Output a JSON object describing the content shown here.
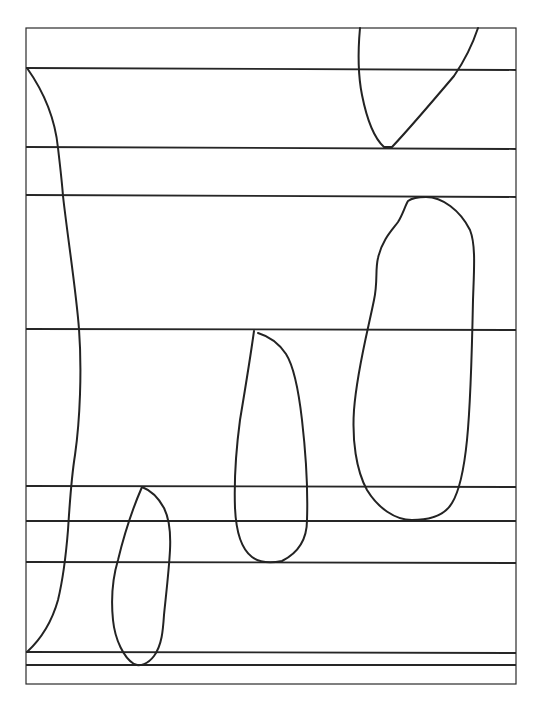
{
  "diagram": {
    "stroke_color": "#232323",
    "background_color": "#ffffff",
    "frame": {
      "x": 26,
      "y": 28,
      "width": 490,
      "height": 656
    },
    "horizontal_lines_y": [
      68,
      148,
      196,
      329,
      486,
      521,
      562,
      652,
      665
    ],
    "shapes": [
      {
        "name": "left-descending-curve",
        "type": "open-curve"
      },
      {
        "name": "top-right-v-curve",
        "type": "open-curve"
      },
      {
        "name": "large-right-loop",
        "type": "closed-loop"
      },
      {
        "name": "middle-loop",
        "type": "open-loop"
      },
      {
        "name": "bottom-left-loop",
        "type": "closed-loop"
      }
    ]
  }
}
